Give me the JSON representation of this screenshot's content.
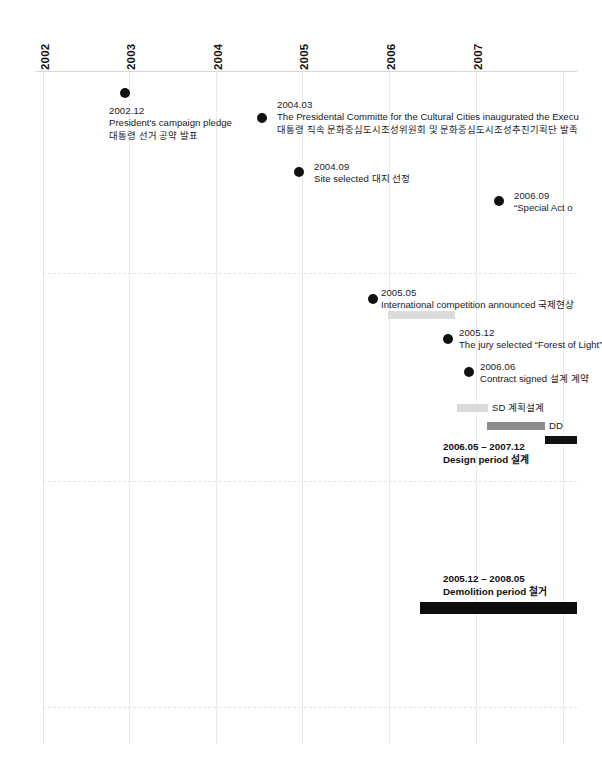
{
  "axis": {
    "years": [
      {
        "label": "2002",
        "x": 43
      },
      {
        "label": "2003",
        "x": 129
      },
      {
        "label": "2004",
        "x": 216
      },
      {
        "label": "2005",
        "x": 302
      },
      {
        "label": "2006",
        "x": 389
      },
      {
        "label": "2007",
        "x": 476
      }
    ]
  },
  "events": [
    {
      "id": "campaign-pledge",
      "date": "2002.12",
      "desc": "President's campaign pledge",
      "kor": "대통령 선거 공약 발표",
      "dot_x": 120,
      "dot_y": 88,
      "text_x": 109,
      "text_y": 105
    },
    {
      "id": "presidential-committee",
      "date": "2004.03",
      "desc": "The Presidental Committe for the Cultural Cities inaugurated the Execu",
      "kor": "대통령 직속 문화중심도시조성위원회 및 문화중심도시조성추진기획단 발족",
      "dot_x": 257,
      "dot_y": 113,
      "text_x": 277,
      "text_y": 99
    },
    {
      "id": "site-selected",
      "date": "2004.09",
      "desc": "Site selected  대지 선정",
      "kor": "",
      "dot_x": 294,
      "dot_y": 167,
      "text_x": 314,
      "text_y": 161
    },
    {
      "id": "special-act",
      "date": "2006.09",
      "desc": "“Special Act o",
      "kor": "",
      "dot_x": 494,
      "dot_y": 196,
      "text_x": 514,
      "text_y": 190
    },
    {
      "id": "international-competition",
      "date": "2005.05",
      "desc": "International competition announced  국제현상",
      "kor": "",
      "dot_x": 368,
      "dot_y": 294,
      "text_x": 381,
      "text_y": 287
    },
    {
      "id": "jury-selected",
      "date": "2005.12",
      "desc": "The jury selected “Forest of Light”",
      "kor": "",
      "dot_x": 443,
      "dot_y": 334,
      "text_x": 459,
      "text_y": 327
    },
    {
      "id": "contract-signed",
      "date": "2006.06",
      "desc": "Contract signed  설계 계약",
      "kor": "",
      "dot_x": 464,
      "dot_y": 367,
      "text_x": 480,
      "text_y": 361
    }
  ],
  "bars": [
    {
      "id": "competition-bar",
      "kind": "comp",
      "x": 388,
      "y": 311,
      "w": 67,
      "label": ""
    },
    {
      "id": "sd-bar",
      "kind": "sd",
      "x": 457,
      "y": 404,
      "w": 31,
      "label": "SD  계획설계",
      "label_x": 492,
      "label_y": 403
    },
    {
      "id": "dd-bar",
      "kind": "dd",
      "x": 487,
      "y": 422,
      "w": 58,
      "label": "DD",
      "label_x": 549,
      "label_y": 421
    },
    {
      "id": "cd-bar",
      "kind": "cd",
      "x": 545,
      "y": 436,
      "w": 32,
      "label": "",
      "label_x": 0,
      "label_y": 0
    },
    {
      "id": "demolition-bar",
      "kind": "demo",
      "x": 420,
      "y": 602,
      "w": 157,
      "label": "",
      "label_x": 0,
      "label_y": 0
    }
  ],
  "periods": [
    {
      "id": "design-period",
      "range": "2006.05 – 2007.12",
      "name": "Design period  설계",
      "x": 443,
      "y": 441
    },
    {
      "id": "demolition-period",
      "range": "2005.12 – 2008.05",
      "name": "Demolition period  철거",
      "x": 443,
      "y": 573
    }
  ],
  "gridlines": {
    "vertical_x": [
      43,
      129,
      216,
      302,
      389,
      476,
      563
    ],
    "vertical_top": 72,
    "vertical_bottom": 745,
    "dashed_y": [
      273,
      481,
      707
    ],
    "dashed_left": 43,
    "dashed_right": 577
  },
  "colors": {
    "dot": "#111111",
    "sd": "#d9d9d9",
    "dd": "#8c8c8c",
    "cd": "#111111",
    "competition": "#dcdcdc",
    "demolition": "#0d0d0d",
    "grid": "#e9e9e9",
    "dashed": "#e2e2e2",
    "axis_rule": "#d7d7d7"
  }
}
